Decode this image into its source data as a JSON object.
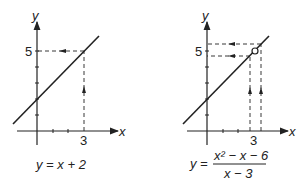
{
  "left_graph": {
    "axis_x_label": "x",
    "axis_y_label": "y",
    "tick_y_label": "5",
    "tick_x_label": "3",
    "equation": "y = x + 2"
  },
  "right_graph": {
    "axis_x_label": "x",
    "axis_y_label": "y",
    "tick_y_label": "5",
    "tick_x_label": "3",
    "equation_lhs": "y =",
    "equation_numerator": "x² − x − 6",
    "equation_denominator": "x − 3"
  },
  "colors": {
    "ink": "#222222",
    "background": "#ffffff"
  }
}
